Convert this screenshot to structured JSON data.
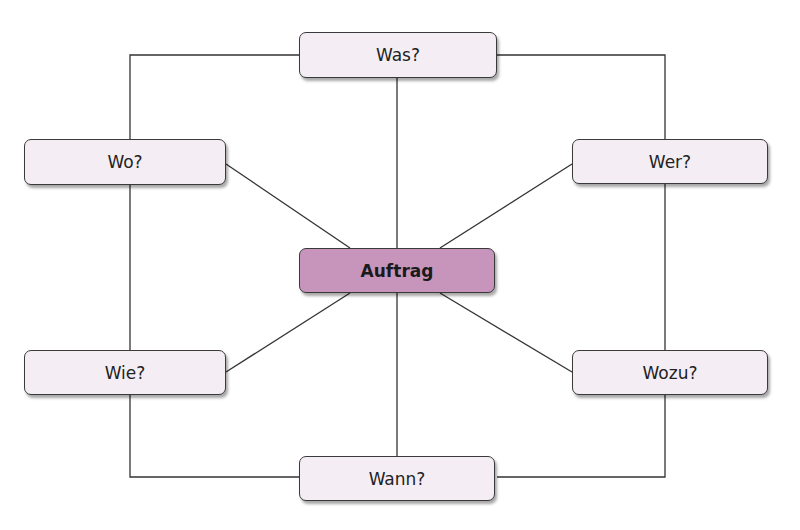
{
  "diagram": {
    "type": "mind-map",
    "center": {
      "label": "Auftrag",
      "color": "#c795bb"
    },
    "nodes": {
      "top": {
        "label": "Was?"
      },
      "upper_left": {
        "label": "Wo?"
      },
      "upper_right": {
        "label": "Wer?"
      },
      "lower_left": {
        "label": "Wie?"
      },
      "lower_right": {
        "label": "Wozu?"
      },
      "bottom": {
        "label": "Wann?"
      }
    },
    "node_fill": "#f4eef4",
    "line_color": "#333333"
  }
}
